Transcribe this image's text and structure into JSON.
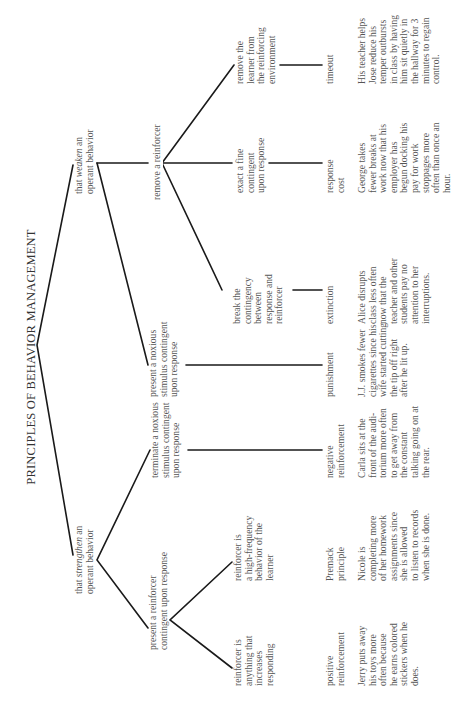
{
  "title": "PRINCIPLES OF BEHAVIOR MANAGEMENT",
  "orientation": "rotated 90° counterclockwise (landscape page shown portrait)",
  "level1": {
    "strengthen": {
      "prefix": "that ",
      "emph": "strengthen",
      "suffix": " an\noperant behavior"
    },
    "weaken": {
      "prefix": "that ",
      "emph": "weaken",
      "suffix": " an\noperant behavior"
    }
  },
  "level2": {
    "present_reinforcer": "present a reinforcer\ncontingent upon response",
    "terminate_noxious": "terminate a noxious\nstimulus contingent\nupon response",
    "present_noxious": "present a noxious\nstimulus contingent\nupon response",
    "remove_reinforcer": "remove a reinforcer"
  },
  "level3": {
    "reinforcer_anything": "reinforcer is\nanything that\nincreases\nresponding",
    "reinforcer_high_freq": "reinforcer is\na high-frequency\nbehavior of the\nlearner",
    "break_contingency": "break the\ncontingency\nbetween\nresponse and\nreinforcer",
    "exact_fine": "exact a fine\ncontingent\nupon response",
    "remove_learner": "remove the\nlearner from\nthe reinforcing\nenvironment"
  },
  "terms": {
    "positive_reinforcement": "positive\nreinforcement",
    "premack": "Premack\nprinciple",
    "negative_reinforcement": "negative\nreinforcement",
    "punishment": "punishment",
    "extinction": "extinction",
    "response_cost": "response\ncost",
    "timeout": "timeout"
  },
  "examples": {
    "positive_reinforcement": "Jerry puts away\nhis toys more\noften because\nhe earns colored\nstickers when he\ndoes.",
    "premack": "Nicole is\ncompleting more\nof her homework\nassignments since\nshe is allowed\nto listen to records\nwhen she is done.",
    "negative_reinforcement": "Carla sits at the\nfront of the audi-\ntorium more often\nto get away from\nthe constant\ntalking going on at\nthe rear.",
    "punishment": "J.J. smokes fewer\ncigarettes since his\nwife started cutting\nthe tip off right\nafter he lit up.",
    "extinction": "Alice disrupts\nclass less often\nnow that the\nteacher and other\nstudents pay no\nattention to her\ninterruptions.",
    "response_cost": "George takes\nfewer breaks at\nwork now that his\nemployer has\nbegun docking his\npay for work\nstoppages more\noften than once an\nhour.",
    "timeout": "His teacher helps\nJose reduce his\ntemper outbursts\nin class by having\nhim sit quietly in\nthe hallway for 3\nminutes to regain\ncontrol."
  },
  "colors": {
    "line": "#1a1a1a",
    "text": "#555555",
    "background": "#ffffff"
  }
}
